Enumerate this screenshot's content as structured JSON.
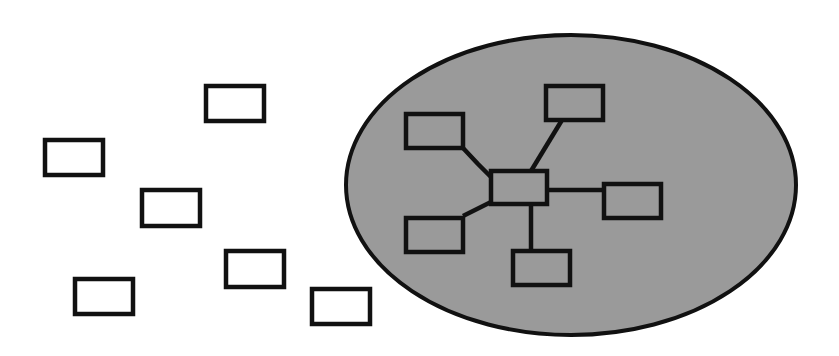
{
  "diagram": {
    "type": "network-cluster",
    "colors": {
      "background": "#ffffff",
      "stroke": "#111111",
      "ellipse_fill": "#9a9a9a",
      "box_fill_outside": "#ffffff",
      "box_fill_inside": "#9a9a9a"
    },
    "cluster": {
      "cx": 571,
      "cy": 185,
      "rx": 225,
      "ry": 150
    },
    "scattered_nodes": [
      {
        "id": "s1",
        "x": 206,
        "y": 86,
        "w": 58,
        "h": 35
      },
      {
        "id": "s2",
        "x": 45,
        "y": 140,
        "w": 58,
        "h": 35
      },
      {
        "id": "s3",
        "x": 142,
        "y": 190,
        "w": 58,
        "h": 36
      },
      {
        "id": "s4",
        "x": 226,
        "y": 251,
        "w": 58,
        "h": 36
      },
      {
        "id": "s5",
        "x": 75,
        "y": 279,
        "w": 58,
        "h": 35
      },
      {
        "id": "s6",
        "x": 312,
        "y": 289,
        "w": 58,
        "h": 35
      }
    ],
    "hub_node": {
      "id": "hub",
      "x": 491,
      "y": 171,
      "w": 56,
      "h": 33
    },
    "spoke_nodes": [
      {
        "id": "n-top-left",
        "x": 406,
        "y": 114,
        "w": 57,
        "h": 34
      },
      {
        "id": "n-top",
        "x": 546,
        "y": 86,
        "w": 57,
        "h": 34
      },
      {
        "id": "n-right",
        "x": 604,
        "y": 184,
        "w": 57,
        "h": 34
      },
      {
        "id": "n-bottom-left",
        "x": 406,
        "y": 218,
        "w": 57,
        "h": 34
      },
      {
        "id": "n-bottom",
        "x": 513,
        "y": 251,
        "w": 57,
        "h": 34
      }
    ],
    "edges": [
      {
        "from": "hub",
        "to": "n-top-left",
        "points": [
          [
            491,
            177
          ],
          [
            478,
            164
          ],
          [
            463,
            148
          ]
        ]
      },
      {
        "from": "hub",
        "to": "n-top",
        "points": [
          [
            531,
            171
          ],
          [
            562,
            120
          ]
        ]
      },
      {
        "from": "hub",
        "to": "n-right",
        "points": [
          [
            547,
            190
          ],
          [
            604,
            190
          ]
        ]
      },
      {
        "from": "hub",
        "to": "n-bottom-left",
        "points": [
          [
            491,
            202
          ],
          [
            463,
            216
          ]
        ]
      },
      {
        "from": "hub",
        "to": "n-bottom",
        "points": [
          [
            531,
            204
          ],
          [
            531,
            251
          ]
        ]
      }
    ]
  }
}
